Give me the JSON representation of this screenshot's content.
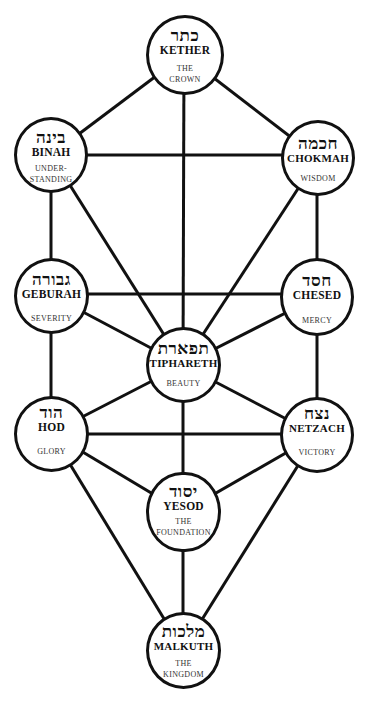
{
  "diagram": {
    "line_color": "#111111",
    "background": "#ffffff"
  },
  "sephiroth": {
    "kether": {
      "hebrew": "כתר",
      "name": "KETHER",
      "meaning_1": "THE",
      "meaning_2": "CROWN"
    },
    "binah": {
      "hebrew": "בינה",
      "name": "BINAH",
      "meaning_1": "UNDER-",
      "meaning_2": "STANDING"
    },
    "chokmah": {
      "hebrew": "חכמה",
      "name": "CHOKMAH",
      "meaning_1": "WISDOM",
      "meaning_2": ""
    },
    "geburah": {
      "hebrew": "גבורה",
      "name": "GEBURAH",
      "meaning_1": "SEVERITY",
      "meaning_2": ""
    },
    "chesed": {
      "hebrew": "חסד",
      "name": "CHESED",
      "meaning_1": "MERCY",
      "meaning_2": ""
    },
    "tiphareth": {
      "hebrew": "תפארת",
      "name": "TIPHARETH",
      "meaning_1": "BEAUTY",
      "meaning_2": ""
    },
    "hod": {
      "hebrew": "הוד",
      "name": "HOD",
      "meaning_1": "GLORY",
      "meaning_2": ""
    },
    "netzach": {
      "hebrew": "נצח",
      "name": "NETZACH",
      "meaning_1": "VICTORY",
      "meaning_2": ""
    },
    "yesod": {
      "hebrew": "יסוד",
      "name": "YESOD",
      "meaning_1": "THE",
      "meaning_2": "FOUNDATION"
    },
    "malkuth": {
      "hebrew": "מלכות",
      "name": "MALKUTH",
      "meaning_1": "THE",
      "meaning_2": "KINGDOM"
    }
  },
  "paths": [
    [
      "kether",
      "binah"
    ],
    [
      "kether",
      "chokmah"
    ],
    [
      "kether",
      "tiphareth"
    ],
    [
      "binah",
      "chokmah"
    ],
    [
      "binah",
      "geburah"
    ],
    [
      "binah",
      "tiphareth"
    ],
    [
      "chokmah",
      "chesed"
    ],
    [
      "chokmah",
      "tiphareth"
    ],
    [
      "geburah",
      "chesed"
    ],
    [
      "geburah",
      "tiphareth"
    ],
    [
      "geburah",
      "hod"
    ],
    [
      "chesed",
      "tiphareth"
    ],
    [
      "chesed",
      "netzach"
    ],
    [
      "tiphareth",
      "hod"
    ],
    [
      "tiphareth",
      "netzach"
    ],
    [
      "tiphareth",
      "yesod"
    ],
    [
      "hod",
      "netzach"
    ],
    [
      "hod",
      "yesod"
    ],
    [
      "hod",
      "malkuth"
    ],
    [
      "netzach",
      "yesod"
    ],
    [
      "netzach",
      "malkuth"
    ],
    [
      "yesod",
      "malkuth"
    ]
  ]
}
